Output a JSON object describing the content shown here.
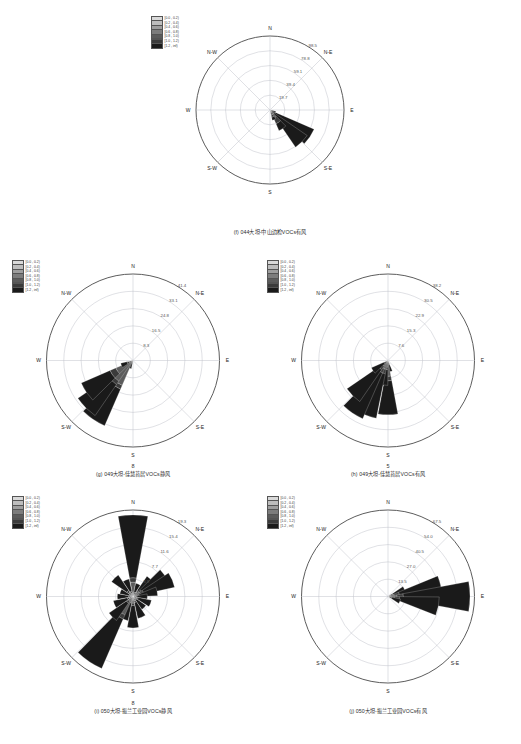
{
  "figure": {
    "page_numbers": [
      "8",
      "5"
    ],
    "legend_labels": [
      "[0.0 , 0.2)",
      "[0.2 , 0.4)",
      "[0.4 , 0.6)",
      "[0.6 , 0.8)",
      "[0.8 , 1.0)",
      "[1.0 , 1.2)",
      "[1.2 , inf)"
    ],
    "legend_colors": [
      "#d9d9d9",
      "#bdbdbd",
      "#9e9e9e",
      "#7d7d7d",
      "#5c5c5c",
      "#3b3b3b",
      "#1a1a1a"
    ],
    "direction_labels": [
      "N",
      "N-E",
      "E",
      "S-E",
      "S",
      "S-W",
      "W",
      "N-W"
    ]
  },
  "chart_data": [
    {
      "id": "panel-f",
      "type": "windrose",
      "title": "(f) 044大坦-中山边检VOCs有风",
      "rticks": [
        "19.7",
        "39.4",
        "59.1",
        "78.8",
        "98.5"
      ],
      "rmax": 98.5,
      "sectors": [
        {
          "dir": 0,
          "total": 0.0,
          "stack": [
            0,
            0,
            0,
            0,
            0,
            0,
            0
          ]
        },
        {
          "dir": 22,
          "total": 0.0,
          "stack": [
            0,
            0,
            0,
            0,
            0,
            0,
            0
          ]
        },
        {
          "dir": 45,
          "total": 0.0,
          "stack": [
            0,
            0,
            0,
            0,
            0,
            0,
            0
          ]
        },
        {
          "dir": 67,
          "total": 0.0,
          "stack": [
            0,
            0,
            0,
            0,
            0,
            0,
            0
          ]
        },
        {
          "dir": 90,
          "total": 0.0,
          "stack": [
            0,
            0,
            0,
            0,
            0,
            0,
            0
          ]
        },
        {
          "dir": 112,
          "total": 8.0,
          "stack": [
            0,
            0,
            0,
            0,
            0,
            2.0,
            6.0
          ]
        },
        {
          "dir": 124,
          "total": 64.0,
          "stack": [
            0,
            0,
            0,
            0,
            2,
            6,
            56.0
          ]
        },
        {
          "dir": 135,
          "total": 60.0,
          "stack": [
            0,
            0,
            0,
            0,
            2,
            5,
            53.0
          ]
        },
        {
          "dir": 146,
          "total": 30.0,
          "stack": [
            0,
            0,
            0,
            4.0,
            8.0,
            8.0,
            10.0
          ]
        },
        {
          "dir": 157,
          "total": 14.0,
          "stack": [
            0,
            0,
            0,
            3.0,
            4.0,
            3.0,
            4.0
          ]
        },
        {
          "dir": 180,
          "total": 0.0,
          "stack": [
            0,
            0,
            0,
            0,
            0,
            0,
            0
          ]
        },
        {
          "dir": 225,
          "total": 0.0,
          "stack": [
            0,
            0,
            0,
            0,
            0,
            0,
            0
          ]
        },
        {
          "dir": 270,
          "total": 0.0,
          "stack": [
            0,
            0,
            0,
            0,
            0,
            0,
            0
          ]
        },
        {
          "dir": 315,
          "total": 0.0,
          "stack": [
            0,
            0,
            0,
            0,
            0,
            0,
            0
          ]
        }
      ]
    },
    {
      "id": "panel-g",
      "type": "windrose",
      "title": "(g) 049大坦-佳慧苔居VOCs静风",
      "rticks": [
        "8.3",
        "16.5",
        "24.8",
        "33.1",
        "41.4"
      ],
      "rmax": 41.4,
      "sectors": [
        {
          "dir": 0,
          "total": 0.0,
          "stack": [
            0,
            0,
            0,
            0,
            0,
            0,
            0
          ]
        },
        {
          "dir": 45,
          "total": 0.0,
          "stack": [
            0,
            0,
            0,
            0,
            0,
            0,
            0
          ]
        },
        {
          "dir": 90,
          "total": 0.0,
          "stack": [
            0,
            0,
            0,
            0,
            0,
            0,
            0
          ]
        },
        {
          "dir": 135,
          "total": 0.0,
          "stack": [
            0,
            0,
            0,
            0,
            0,
            0,
            0
          ]
        },
        {
          "dir": 180,
          "total": 0.0,
          "stack": [
            0,
            0,
            0,
            0,
            0,
            0,
            0
          ]
        },
        {
          "dir": 202,
          "total": 4.0,
          "stack": [
            0,
            0,
            0,
            0,
            0,
            1.0,
            3.0
          ]
        },
        {
          "dir": 214,
          "total": 34.0,
          "stack": [
            0,
            0,
            0,
            0,
            13.0,
            2.0,
            19.0
          ]
        },
        {
          "dir": 225,
          "total": 32.0,
          "stack": [
            0,
            0,
            0,
            0,
            12.0,
            2.0,
            18.0
          ]
        },
        {
          "dir": 236,
          "total": 27.0,
          "stack": [
            0,
            0,
            0,
            0,
            9.0,
            3.0,
            15.0
          ]
        },
        {
          "dir": 247,
          "total": 6.0,
          "stack": [
            0,
            0,
            0,
            0,
            2.0,
            1.0,
            3.0
          ]
        },
        {
          "dir": 270,
          "total": 0.0,
          "stack": [
            0,
            0,
            0,
            0,
            0,
            0,
            0
          ]
        },
        {
          "dir": 315,
          "total": 0.0,
          "stack": [
            0,
            0,
            0,
            0,
            0,
            0,
            0
          ]
        }
      ]
    },
    {
      "id": "panel-h",
      "type": "windrose",
      "title": "(h) 049大坦-佳慧苔居VOCs有风",
      "rticks": [
        "7.6",
        "15.3",
        "22.9",
        "30.5",
        "38.2"
      ],
      "rmax": 38.2,
      "sectors": [
        {
          "dir": 0,
          "total": 0.0,
          "stack": [
            0,
            0,
            0,
            0,
            0,
            0,
            0
          ]
        },
        {
          "dir": 45,
          "total": 0.0,
          "stack": [
            0,
            0,
            0,
            0,
            0,
            0,
            0
          ]
        },
        {
          "dir": 90,
          "total": 0.0,
          "stack": [
            0,
            0,
            0,
            0,
            0,
            0,
            0
          ]
        },
        {
          "dir": 135,
          "total": 0.0,
          "stack": [
            0,
            0,
            0,
            0,
            0,
            0,
            0
          ]
        },
        {
          "dir": 168,
          "total": 5.0,
          "stack": [
            0,
            0,
            0,
            0,
            1.0,
            1.0,
            3.0
          ]
        },
        {
          "dir": 180,
          "total": 24.0,
          "stack": [
            0,
            0,
            0,
            0,
            7.0,
            2.0,
            15.0
          ]
        },
        {
          "dir": 191,
          "total": 11.0,
          "stack": [
            0,
            0,
            0,
            0,
            3.0,
            1.0,
            7.0
          ]
        },
        {
          "dir": 202,
          "total": 26.0,
          "stack": [
            0,
            0,
            0,
            0,
            4.0,
            2.0,
            20.0
          ]
        },
        {
          "dir": 214,
          "total": 28.0,
          "stack": [
            0,
            0,
            0,
            0,
            4.0,
            2.0,
            22.0
          ]
        },
        {
          "dir": 225,
          "total": 22.0,
          "stack": [
            0,
            0,
            0,
            0,
            3.0,
            2.0,
            17.0
          ]
        },
        {
          "dir": 236,
          "total": 8.0,
          "stack": [
            0,
            0,
            0,
            0,
            1.0,
            1.0,
            6.0
          ]
        },
        {
          "dir": 270,
          "total": 0.0,
          "stack": [
            0,
            0,
            0,
            0,
            0,
            0,
            0
          ]
        },
        {
          "dir": 315,
          "total": 0.0,
          "stack": [
            0,
            0,
            0,
            0,
            0,
            0,
            0
          ]
        }
      ]
    },
    {
      "id": "panel-i",
      "type": "windrose",
      "title": "(i) 050大坦-振兰工业园VOCs静风",
      "rticks": [
        "3.9",
        "7.7",
        "11.6",
        "15.4",
        "19.3"
      ],
      "rmax": 19.3,
      "sectors": [
        {
          "dir": 0,
          "total": 18.2,
          "stack": [
            0,
            0,
            0,
            0,
            3.2,
            1.0,
            14.0
          ]
        },
        {
          "dir": 22,
          "total": 3.0,
          "stack": [
            0,
            0,
            0,
            0,
            0.6,
            0.4,
            2.0
          ]
        },
        {
          "dir": 45,
          "total": 5.5,
          "stack": [
            0,
            0,
            0,
            0,
            1.2,
            0.5,
            3.8
          ]
        },
        {
          "dir": 56,
          "total": 8.5,
          "stack": [
            0,
            0,
            0,
            0,
            1.6,
            0.6,
            6.3
          ]
        },
        {
          "dir": 67,
          "total": 9.5,
          "stack": [
            0,
            0,
            0,
            0,
            1.8,
            0.7,
            7.0
          ]
        },
        {
          "dir": 78,
          "total": 5.5,
          "stack": [
            0,
            0,
            0,
            0,
            1.0,
            0.4,
            4.1
          ]
        },
        {
          "dir": 90,
          "total": 3.2,
          "stack": [
            0,
            0,
            0,
            0,
            0.6,
            0.3,
            2.3
          ]
        },
        {
          "dir": 112,
          "total": 4.2,
          "stack": [
            0,
            0,
            0,
            0,
            0.8,
            0.4,
            3.0
          ]
        },
        {
          "dir": 135,
          "total": 3.5,
          "stack": [
            0,
            0,
            0,
            0,
            0.7,
            0.3,
            2.5
          ]
        },
        {
          "dir": 157,
          "total": 5.0,
          "stack": [
            0,
            0,
            0,
            0,
            1.0,
            0.4,
            3.6
          ]
        },
        {
          "dir": 180,
          "total": 7.0,
          "stack": [
            0,
            0,
            0,
            0,
            1.5,
            0.5,
            5.0
          ]
        },
        {
          "dir": 202,
          "total": 5.5,
          "stack": [
            0,
            0,
            0,
            0,
            1.1,
            0.4,
            4.0
          ]
        },
        {
          "dir": 214,
          "total": 17.5,
          "stack": [
            0,
            0,
            0,
            0,
            4.5,
            1.0,
            12.0
          ]
        },
        {
          "dir": 225,
          "total": 6.5,
          "stack": [
            0,
            0,
            0,
            0,
            1.3,
            0.5,
            4.7
          ]
        },
        {
          "dir": 247,
          "total": 4.5,
          "stack": [
            0,
            0,
            0,
            0,
            0.9,
            0.4,
            3.2
          ]
        },
        {
          "dir": 270,
          "total": 3.5,
          "stack": [
            0,
            0,
            0,
            0,
            0.7,
            0.3,
            2.5
          ]
        },
        {
          "dir": 292,
          "total": 3.0,
          "stack": [
            0,
            0,
            0,
            0,
            0.6,
            0.3,
            2.1
          ]
        },
        {
          "dir": 315,
          "total": 5.8,
          "stack": [
            0,
            0,
            0,
            0,
            1.2,
            0.5,
            4.1
          ]
        },
        {
          "dir": 337,
          "total": 4.0,
          "stack": [
            0,
            0,
            0,
            0,
            0.8,
            0.4,
            2.8
          ]
        }
      ]
    },
    {
      "id": "panel-j",
      "type": "windrose",
      "title": "(j) 050大坦-振兰工业园VOCs有风",
      "rticks": [
        "13.5",
        "27.0",
        "40.5",
        "54.0",
        "67.5"
      ],
      "rmax": 67.5,
      "sectors": [
        {
          "dir": 0,
          "total": 0.0,
          "stack": [
            0,
            0,
            0,
            0,
            0,
            0,
            0
          ]
        },
        {
          "dir": 45,
          "total": 0.0,
          "stack": [
            0,
            0,
            0,
            0,
            0,
            0,
            0
          ]
        },
        {
          "dir": 67,
          "total": 14.0,
          "stack": [
            0,
            0,
            0,
            0,
            2.0,
            2.0,
            10.0
          ]
        },
        {
          "dir": 78,
          "total": 42.0,
          "stack": [
            0,
            0,
            0,
            0,
            5.0,
            4.0,
            33.0
          ]
        },
        {
          "dir": 90,
          "total": 64.0,
          "stack": [
            0,
            0,
            0,
            0,
            7.0,
            5.0,
            52.0
          ]
        },
        {
          "dir": 101,
          "total": 40.0,
          "stack": [
            0,
            0,
            0,
            0,
            5.0,
            4.0,
            31.0
          ]
        },
        {
          "dir": 112,
          "total": 10.0,
          "stack": [
            0,
            0,
            0,
            0,
            1.5,
            1.5,
            7.0
          ]
        },
        {
          "dir": 135,
          "total": 0.0,
          "stack": [
            0,
            0,
            0,
            0,
            0,
            0,
            0
          ]
        },
        {
          "dir": 180,
          "total": 0.0,
          "stack": [
            0,
            0,
            0,
            0,
            0,
            0,
            0
          ]
        },
        {
          "dir": 225,
          "total": 0.0,
          "stack": [
            0,
            0,
            0,
            0,
            0,
            0,
            0
          ]
        },
        {
          "dir": 270,
          "total": 0.0,
          "stack": [
            0,
            0,
            0,
            0,
            0,
            0,
            0
          ]
        },
        {
          "dir": 315,
          "total": 0.0,
          "stack": [
            0,
            0,
            0,
            0,
            0,
            0,
            0
          ]
        }
      ]
    }
  ]
}
